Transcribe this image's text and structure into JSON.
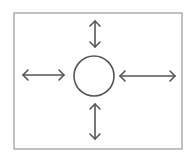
{
  "diagram": {
    "colors": {
      "background": "#ffffff",
      "frame": "#9a9a9a",
      "stroke": "#555555"
    },
    "frame": {
      "x": 14,
      "y": 13,
      "width": 168,
      "height": 136
    },
    "circle": {
      "cx": 94,
      "cy": 76,
      "r": 20
    },
    "arrows": [
      {
        "name": "top",
        "x1": 95,
        "y1": 21,
        "x2": 95,
        "y2": 47
      },
      {
        "name": "bottom",
        "x1": 95,
        "y1": 104,
        "x2": 95,
        "y2": 139
      },
      {
        "name": "left",
        "x1": 23,
        "y1": 75,
        "x2": 64,
        "y2": 75
      },
      {
        "name": "right",
        "x1": 120,
        "y1": 76,
        "x2": 175,
        "y2": 76
      }
    ]
  }
}
